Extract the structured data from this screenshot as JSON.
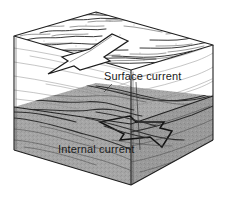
{
  "figure": {
    "type": "isometric-block-diagram",
    "background_color": "#ffffff",
    "ink_color": "#1f1f1f"
  },
  "labels": {
    "surface_current": "Surface current",
    "internal_current": "Internal current"
  },
  "layers": [
    {
      "name": "upper-water-layer",
      "fill": "#ffffff",
      "description": "white upper water layer"
    },
    {
      "name": "lower-water-layer",
      "fill": "#a3a3a3",
      "description": "shaded denser lower water layer"
    }
  ],
  "arrows": [
    {
      "name": "surface-current-arrow",
      "direction": "lower-left",
      "style": "hollow-outline"
    },
    {
      "name": "internal-current-arrow",
      "direction": "right",
      "style": "hollow-outline"
    }
  ]
}
